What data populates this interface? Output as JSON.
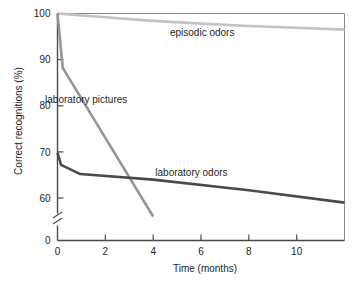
{
  "chart_data": {
    "type": "line",
    "title": "",
    "xlabel": "Time (months)",
    "ylabel": "Correct recognitions (%)",
    "xlim": [
      0,
      12
    ],
    "ylim": [
      0,
      100
    ],
    "y_axis_break": true,
    "y_break_between": [
      0,
      56
    ],
    "grid": false,
    "legend_position": "inline-annotations",
    "xticks": [
      0,
      2,
      4,
      6,
      8,
      10
    ],
    "xticklabels": [
      "0",
      "2",
      "4",
      "6",
      "8",
      "10"
    ],
    "yticks": [
      0,
      60,
      70,
      80,
      90,
      100
    ],
    "yticklabels": [
      "0",
      "60",
      "70",
      "80",
      "90",
      "100"
    ],
    "series": [
      {
        "name": "episodic odors",
        "color": "#c3c3c3",
        "label_x": 6.05,
        "label_y": 95.2,
        "x": [
          0,
          1,
          2,
          4,
          6,
          8,
          10,
          12
        ],
        "y": [
          100,
          99.6,
          99.2,
          98.4,
          97.8,
          97.3,
          96.9,
          96.5
        ]
      },
      {
        "name": "laboratory pictures",
        "color": "#969696",
        "label_x": 1.2,
        "label_y": 80.6,
        "x": [
          0,
          0.22,
          4
        ],
        "y": [
          100,
          88.2,
          56.0
        ]
      },
      {
        "name": "laboratory odors",
        "color": "#4a4a4a",
        "label_x": 5.6,
        "label_y": 64.8,
        "x": [
          0,
          0.15,
          0.95,
          4,
          8,
          12
        ],
        "y": [
          69.8,
          67.2,
          65.2,
          64.0,
          61.7,
          59.0
        ]
      }
    ]
  }
}
